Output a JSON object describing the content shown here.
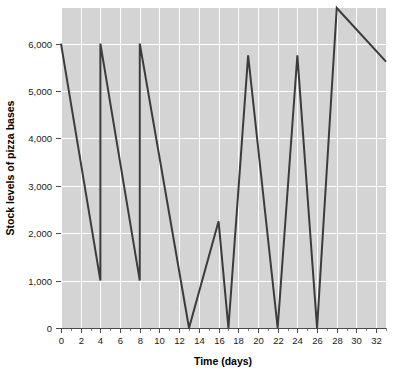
{
  "chart_data": {
    "type": "line",
    "title": "",
    "xlabel": "Time (days)",
    "ylabel": "Stock levels of pizza bases",
    "xlim": [
      0,
      33
    ],
    "ylim": [
      0,
      6750
    ],
    "grid": true,
    "legend": "none",
    "x_tick_labels": [
      "0",
      "2",
      "4",
      "6",
      "8",
      "10",
      "12",
      "14",
      "16",
      "18",
      "20",
      "22",
      "24",
      "26",
      "28",
      "30",
      "32"
    ],
    "x_tick_values": [
      0,
      2,
      4,
      6,
      8,
      10,
      12,
      14,
      16,
      18,
      20,
      22,
      24,
      26,
      28,
      30,
      32
    ],
    "x_minor_tick_values": [
      1,
      3,
      5,
      7,
      9,
      11,
      13,
      15,
      17,
      19,
      21,
      23,
      25,
      27,
      29,
      31,
      33
    ],
    "y_tick_labels": [
      "0",
      "1,000",
      "2,000",
      "3,000",
      "4,000",
      "5,000",
      "6,000"
    ],
    "y_tick_values": [
      0,
      1000,
      2000,
      3000,
      4000,
      5000,
      6000
    ],
    "series": [
      {
        "name": "Stock level",
        "points": [
          [
            0,
            6000
          ],
          [
            4,
            1000
          ],
          [
            4,
            6000
          ],
          [
            8,
            1000
          ],
          [
            8,
            6000
          ],
          [
            13,
            0
          ],
          [
            16,
            2250
          ],
          [
            17,
            0
          ],
          [
            19,
            5750
          ],
          [
            22,
            0
          ],
          [
            24,
            5750
          ],
          [
            26,
            0
          ],
          [
            28,
            6750
          ],
          [
            33,
            5620
          ]
        ]
      }
    ],
    "colors": {
      "panel_background": "#d4d4d4",
      "figure_background": "#ffffff",
      "gridline": "#ffffff",
      "line": "#3b3b3b",
      "axis": "#4a4a4a",
      "text": "#1a1a1a"
    }
  }
}
